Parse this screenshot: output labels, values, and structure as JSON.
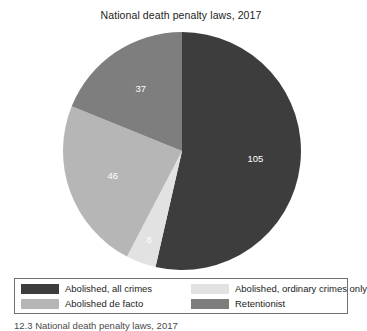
{
  "chart_data": {
    "type": "pie",
    "title": "National death penalty laws, 2017",
    "xlabel": "",
    "ylabel": "",
    "total": 196,
    "legend_position": "bottom",
    "grid": false,
    "categories": [
      "Abolished, all crimes",
      "Abolished, ordinary crimes only",
      "Abolished de facto",
      "Retentionist"
    ],
    "values": [
      105,
      8,
      46,
      37
    ],
    "slices": [
      {
        "label": "Abolished, all crimes",
        "value": 105,
        "data_label": "105",
        "color": "#3d3d3d",
        "label_color": "#ffffff",
        "start_angle_deg": 0,
        "end_angle_deg": 192.86
      },
      {
        "label": "Abolished, ordinary crimes only",
        "value": 8,
        "data_label": "8",
        "color": "#e2e2e2",
        "label_color": "#2e2e2e",
        "start_angle_deg": 192.86,
        "end_angle_deg": 207.55
      },
      {
        "label": "Abolished de facto",
        "value": 46,
        "data_label": "46",
        "color": "#b6b6b6",
        "label_color": "#ffffff",
        "start_angle_deg": 207.55,
        "end_angle_deg": 292.04
      },
      {
        "label": "Retentionist",
        "value": 37,
        "data_label": "37",
        "color": "#7e7e7e",
        "label_color": "#ffffff",
        "start_angle_deg": 292.04,
        "end_angle_deg": 360
      }
    ]
  },
  "chart": {
    "title": "National death penalty laws, 2017",
    "labels": {
      "slice_1": "105",
      "slice_2": "8",
      "slice_3": "46",
      "slice_4": "37"
    }
  },
  "legend": {
    "entries": [
      {
        "label": "Abolished, all crimes",
        "color": "#3d3d3d"
      },
      {
        "label": "Abolished, ordinary crimes only",
        "color": "#e2e2e2"
      },
      {
        "label": "Abolished de facto",
        "color": "#b6b6b6"
      },
      {
        "label": "Retentionist",
        "color": "#7e7e7e"
      }
    ]
  },
  "caption": {
    "text": "12.3 National death penalty laws, 2017"
  },
  "colors": {
    "background": "#ffffff",
    "text": "#1c1c1c",
    "legend_border": "#6f6f6f",
    "abolished_all_crimes": "#3d3d3d",
    "abolished_ordinary_only": "#e2e2e2",
    "abolished_de_facto": "#b6b6b6",
    "retentionist": "#7e7e7e"
  }
}
